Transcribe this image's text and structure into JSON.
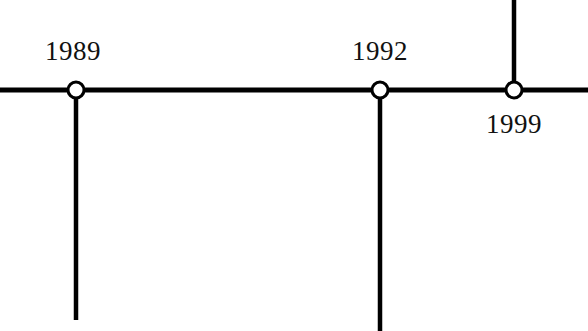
{
  "figure": {
    "type": "timeline",
    "orientation": "horizontal",
    "background_color": "#ffffff",
    "line_color": "#000000",
    "text_color": "#111111",
    "node_fill_color": "#ffffff",
    "axis_y": 90,
    "axis_thickness": 5,
    "stem_thickness": 4.5,
    "node_radius": 8,
    "node_stroke_width": 3
  },
  "axis": {
    "x_start": 0,
    "x_end": 588,
    "y": 90
  },
  "events": [
    {
      "label": "1989",
      "node_x": 76,
      "node_y": 90,
      "stem_direction": "down",
      "stem_end_y": 320,
      "label_position": "above",
      "label_x": 45,
      "label_y": 38
    },
    {
      "label": "1992",
      "node_x": 380,
      "node_y": 90,
      "stem_direction": "down",
      "stem_end_y": 331,
      "label_position": "above",
      "label_x": 352,
      "label_y": 38
    },
    {
      "label": "1999",
      "node_x": 514,
      "node_y": 90,
      "stem_direction": "up",
      "stem_end_y": 0,
      "label_position": "below",
      "label_x": 486,
      "label_y": 111
    }
  ]
}
